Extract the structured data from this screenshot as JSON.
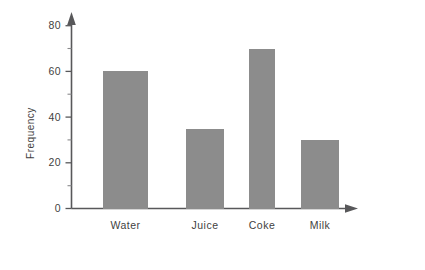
{
  "chart_data": {
    "type": "bar",
    "title": "",
    "subtitle": "",
    "xlabel": "",
    "ylabel": "Frequency",
    "categories": [
      "Water",
      "Juice",
      "Coke",
      "Milk"
    ],
    "values": [
      60,
      35,
      70,
      30
    ],
    "ylim": [
      0,
      88
    ],
    "y_major_ticks": [
      0,
      20,
      40,
      60,
      80
    ],
    "y_minor_ticks": [
      10,
      30,
      50,
      70,
      80
    ],
    "y_tick_labels": [
      "0",
      "20",
      "40",
      "60",
      "80"
    ],
    "grid": false,
    "legend": false,
    "legend_position": "none",
    "bar_color": "#8c8c8c",
    "axis_color": "#58585a",
    "background_color": "#ffffff",
    "axis_arrows": [
      "y-up",
      "x-right"
    ],
    "bars": [
      {
        "category": "Water",
        "value": 60,
        "label": "Water"
      },
      {
        "category": "Juice",
        "value": 35,
        "label": "Juice"
      },
      {
        "category": "Coke",
        "value": 70,
        "label": "Coke"
      },
      {
        "category": "Milk",
        "value": 30,
        "label": "Milk"
      }
    ]
  }
}
